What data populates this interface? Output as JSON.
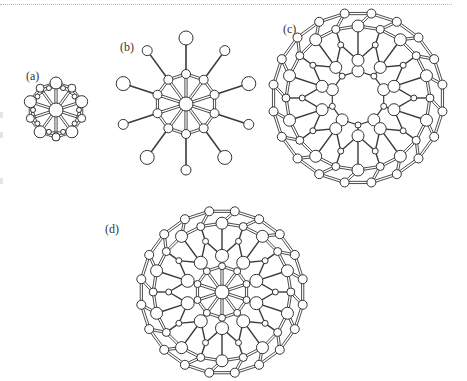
{
  "figure": {
    "panels": [
      {
        "id": "a",
        "label": "(a)",
        "description": "Small ring cage with 10-spoke hub",
        "label_pos": [
          26,
          75
        ]
      },
      {
        "id": "b",
        "label": "(b)",
        "description": "Ring cage with 10 radial arms terminated by atoms",
        "label_pos": [
          120,
          46
        ]
      },
      {
        "id": "c",
        "label": "(c)",
        "description": "Fullerene-like cage with central hollow ring",
        "label_pos": [
          283,
          28
        ]
      },
      {
        "id": "d",
        "label": "(d)",
        "description": "Large fullerene-like cage with central 10-spoke hub",
        "label_pos": [
          105,
          228
        ]
      }
    ],
    "colors": {
      "bond": "#3a3a3a",
      "atom_fill": "#ffffff",
      "atom_stroke": "#333333",
      "rule": "#d9a9a9"
    }
  }
}
